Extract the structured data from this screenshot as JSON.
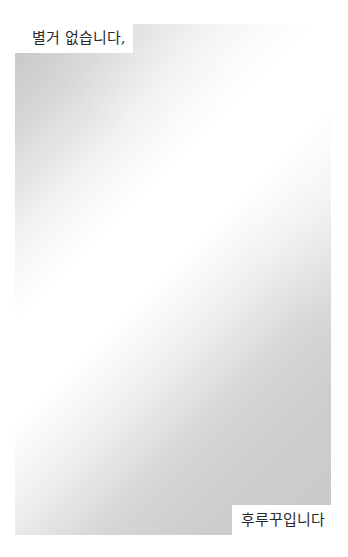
{
  "caption_top": "별거 없습니다,",
  "caption_bottom": "후루꾸입니다",
  "colors": {
    "background": "#ffffff",
    "panel_dark": "#c4c4c4",
    "panel_light": "#ffffff",
    "text": "#2a2a2a"
  }
}
